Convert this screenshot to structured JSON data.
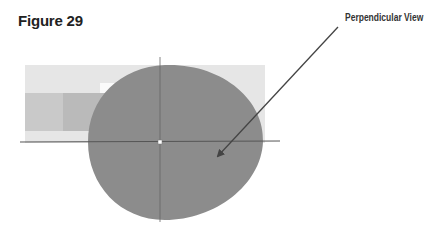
{
  "figure": {
    "title": "Figure 29",
    "annotation_label": "Perpendicular View"
  },
  "colors": {
    "background": "#ffffff",
    "outer_rect": "#e6e6e6",
    "inner_band": "#c8c8c8",
    "inner_block": "#b9b9b9",
    "ellipse_fill": "#8c8c8c",
    "lines": "#555555",
    "arrow": "#444444"
  }
}
